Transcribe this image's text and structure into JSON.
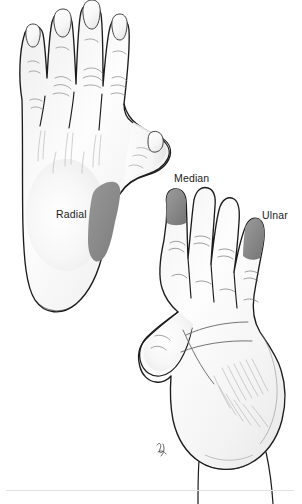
{
  "figure": {
    "name": "hand-nerve-distribution",
    "background_color": "#ffffff"
  },
  "labels": {
    "radial": "Radial",
    "median": "Median",
    "ulnar": "Ulnar"
  },
  "colors": {
    "shading_gray": "#8a8a8a",
    "shading_gray_dark": "#7c7c7c",
    "skin_fill": "#fbfbfb",
    "outline": "#1c1c1c",
    "crease": "#6f6f6f",
    "rule": "#e2e2e2",
    "label_text": "#1b1b1b"
  },
  "views": [
    {
      "name": "dorsal-hand",
      "orientation": "dorsal",
      "side": "left",
      "description": "Back of the hand showing four fingers with nails and the thumb",
      "shaded_region": "radial",
      "digits": [
        "little",
        "ring",
        "middle",
        "index",
        "thumb"
      ]
    },
    {
      "name": "palmar-hand",
      "orientation": "palmar",
      "side": "right",
      "description": "Palm of the hand showing palmar creases, thenar eminence and thumb",
      "shaded_regions": [
        "median",
        "ulnar"
      ],
      "digits": [
        "thumb",
        "index",
        "middle",
        "ring",
        "little"
      ]
    }
  ],
  "shaded_areas": [
    {
      "nerve": "Radial",
      "view": "dorsal-hand",
      "location": "first dorsal web space",
      "color": "#8a8a8a"
    },
    {
      "nerve": "Median",
      "view": "palmar-hand",
      "location": "index fingertip pulp",
      "color": "#8a8a8a"
    },
    {
      "nerve": "Ulnar",
      "view": "palmar-hand",
      "location": "little fingertip pulp",
      "color": "#8a8a8a"
    }
  ]
}
